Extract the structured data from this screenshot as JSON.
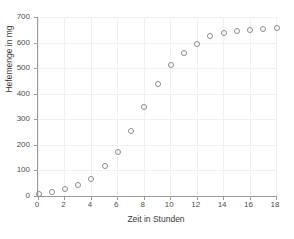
{
  "chart_data": {
    "type": "scatter",
    "title": "",
    "xlabel": "Zeit in Stunden",
    "ylabel": "Hefemenge in mg",
    "xlim": [
      0,
      18
    ],
    "ylim": [
      0,
      700
    ],
    "xticks": [
      0,
      2,
      4,
      6,
      8,
      10,
      12,
      14,
      16,
      18
    ],
    "xtick_labels": [
      "0",
      "2",
      "4",
      "6",
      "8",
      "10",
      "12",
      "14",
      "16",
      "18"
    ],
    "yticks": [
      0,
      100,
      200,
      300,
      400,
      500,
      600,
      700
    ],
    "ytick_labels": [
      "0",
      "100",
      "200",
      "300",
      "400",
      "500",
      "600",
      "700"
    ],
    "grid": true,
    "legend": null,
    "marker": "open-circle",
    "marker_color": "#8c8c8c",
    "axis_color": "#9a9a9a",
    "grid_color": "#f0f0f0",
    "background": "#ffffff",
    "x": [
      0,
      1,
      2,
      3,
      4,
      5,
      6,
      7,
      8,
      9,
      10,
      11,
      12,
      13,
      14,
      15,
      16,
      17,
      18
    ],
    "values": [
      10,
      18,
      28,
      45,
      70,
      118,
      175,
      257,
      350,
      441,
      513,
      560,
      595,
      628,
      638,
      648,
      652,
      656,
      659
    ]
  }
}
